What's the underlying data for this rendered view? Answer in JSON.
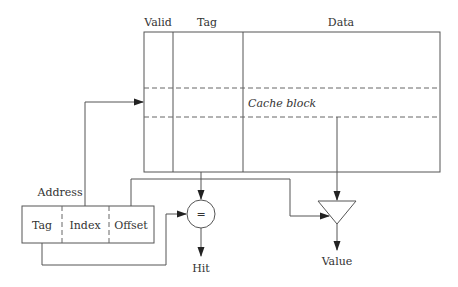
{
  "diagram": {
    "cache": {
      "columns": [
        "Valid",
        "Tag",
        "Data"
      ],
      "block_label": "Cache block"
    },
    "address": {
      "label": "Address",
      "fields": [
        "Tag",
        "Index",
        "Offset"
      ]
    },
    "comparator": {
      "symbol": "=",
      "output_label": "Hit"
    },
    "mux": {
      "output_label": "Value"
    },
    "colors": {
      "line": "#555555",
      "text": "#333333",
      "background": "#ffffff"
    }
  }
}
